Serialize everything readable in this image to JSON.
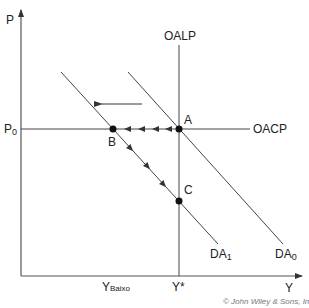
{
  "diagram": {
    "type": "economics-ad-as",
    "axes": {
      "y_label": "P",
      "x_label": "Y"
    },
    "curves": {
      "long_run_supply": "OALP",
      "short_run_supply": "OACP",
      "demand_initial": {
        "base": "DA",
        "sub": "0"
      },
      "demand_shifted": {
        "base": "DA",
        "sub": "1"
      }
    },
    "price_level": {
      "base": "P",
      "sub": "0"
    },
    "x_ticks": {
      "low_output": {
        "base": "Y",
        "super": "Baixo"
      },
      "potential_output": "Y*"
    },
    "points": [
      {
        "label": "A",
        "description": "intersection of OALP, OACP and DA0"
      },
      {
        "label": "B",
        "description": "intersection of OACP and DA1"
      },
      {
        "label": "C",
        "description": "intersection of OALP and DA1"
      }
    ],
    "paths": [
      {
        "from": "A",
        "to": "B",
        "direction": "left",
        "arrowheads": 4
      },
      {
        "from": "B",
        "to": "C",
        "direction": "down-right",
        "arrowheads": 3
      }
    ],
    "shift_arrow": {
      "direction": "left",
      "meaning": "demand shifts from DA0 to DA1"
    },
    "credit": "© John Wiley & Sons, Inc."
  },
  "colors": {
    "line": "#333333",
    "axis": "#555555",
    "text": "#222222",
    "credit": "#777777",
    "background": "#ffffff"
  }
}
